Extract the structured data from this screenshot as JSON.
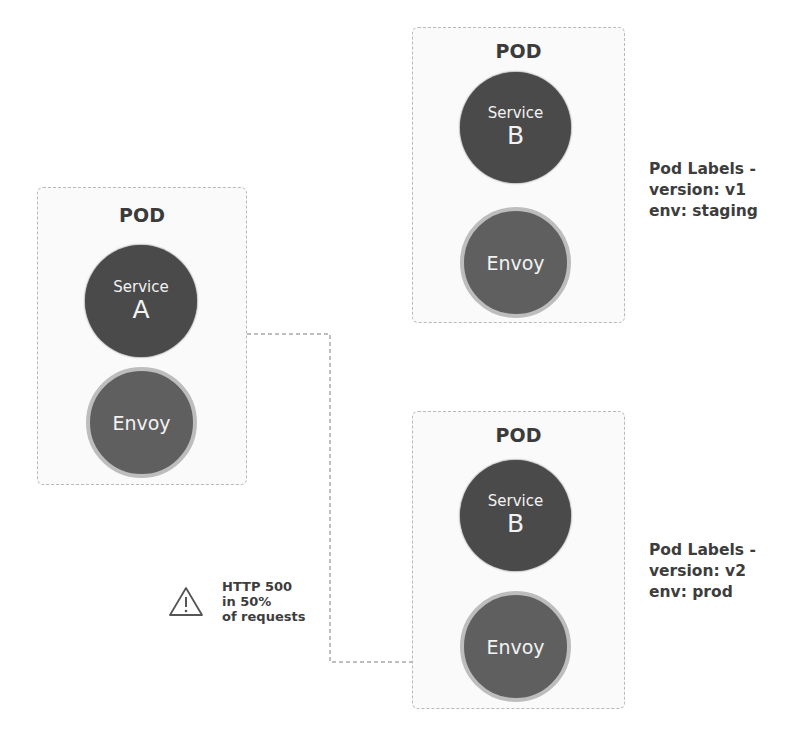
{
  "diagram": {
    "pods": [
      {
        "id": "pod-a",
        "title": "POD",
        "service": {
          "label": "Service",
          "name": "A"
        },
        "sidecar": {
          "label": "Envoy"
        }
      },
      {
        "id": "pod-b-v1",
        "title": "POD",
        "service": {
          "label": "Service",
          "name": "B"
        },
        "sidecar": {
          "label": "Envoy"
        },
        "labels": {
          "heading": "Pod Labels -",
          "version": "version: v1",
          "env": "env: staging"
        }
      },
      {
        "id": "pod-b-v2",
        "title": "POD",
        "service": {
          "label": "Service",
          "name": "B"
        },
        "sidecar": {
          "label": "Envoy"
        },
        "labels": {
          "heading": "Pod Labels -",
          "version": "version: v2",
          "env": "env: prod"
        }
      }
    ],
    "fault": {
      "icon": "warning-icon",
      "line1": "HTTP 500",
      "line2": "in 50%",
      "line3": "of requests"
    },
    "colors": {
      "service_fill": "#4a4a4a",
      "envoy_fill": "#5f5f5f",
      "envoy_ring": "#bdbdbd",
      "pod_border": "#b9b9b9",
      "text": "#3d3d3d"
    }
  }
}
